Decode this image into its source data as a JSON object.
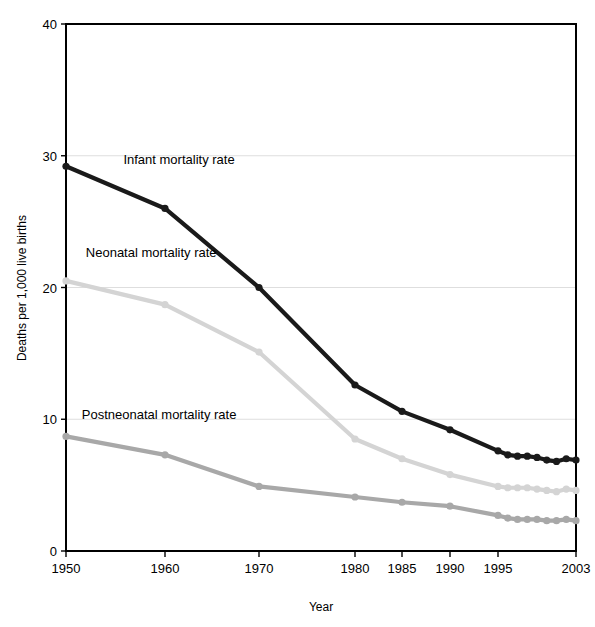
{
  "chart_data": {
    "type": "line",
    "title": "",
    "xlabel": "Year",
    "ylabel": "Deaths per 1,000 live births",
    "xlim": [
      1950,
      2003
    ],
    "ylim": [
      0,
      40
    ],
    "yticks": [
      0,
      10,
      20,
      30,
      40
    ],
    "ytick_labels": [
      "0",
      "10",
      "20",
      "30",
      "40"
    ],
    "xticks": [
      1950,
      1960,
      1970,
      1980,
      1985,
      1990,
      1995,
      2003
    ],
    "xtick_labels": [
      "1950",
      "1960",
      "1970",
      "1980",
      "1985",
      "1990",
      "1995",
      "2003"
    ],
    "grid": "horizontal",
    "legend_position": "inline-labels",
    "series": [
      {
        "name": "Infant mortality rate",
        "color": "#1a1a1a",
        "label_x": 1955.8,
        "label_y": 29.4,
        "x": [
          1950,
          1960,
          1970,
          1980,
          1985,
          1990,
          1995,
          1996,
          1997,
          1998,
          1999,
          2000,
          2001,
          2002,
          2003
        ],
        "values": [
          29.2,
          26.0,
          20.0,
          12.6,
          10.6,
          9.2,
          7.6,
          7.3,
          7.2,
          7.2,
          7.1,
          6.9,
          6.8,
          7.0,
          6.9
        ]
      },
      {
        "name": "Neonatal mortality rate",
        "color": "#d4d4d4",
        "label_x": 1952.0,
        "label_y": 22.3,
        "x": [
          1950,
          1960,
          1970,
          1980,
          1985,
          1990,
          1995,
          1996,
          1997,
          1998,
          1999,
          2000,
          2001,
          2002,
          2003
        ],
        "values": [
          20.5,
          18.7,
          15.1,
          8.5,
          7.0,
          5.8,
          4.9,
          4.8,
          4.8,
          4.8,
          4.7,
          4.6,
          4.5,
          4.7,
          4.6
        ]
      },
      {
        "name": "Postneonatal mortality rate",
        "color": "#a8a8a8",
        "label_x": 1951.6,
        "label_y": 10.0,
        "x": [
          1950,
          1960,
          1970,
          1980,
          1985,
          1990,
          1995,
          1996,
          1997,
          1998,
          1999,
          2000,
          2001,
          2002,
          2003
        ],
        "values": [
          8.7,
          7.3,
          4.9,
          4.1,
          3.7,
          3.4,
          2.7,
          2.5,
          2.4,
          2.4,
          2.4,
          2.3,
          2.3,
          2.4,
          2.3
        ]
      }
    ]
  },
  "axis": {
    "y_title": "Deaths per 1,000 live births",
    "x_title": "Year"
  }
}
